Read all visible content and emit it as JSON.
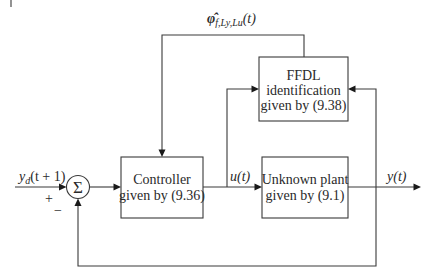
{
  "diagram": {
    "type": "control-block-diagram",
    "blocks": [
      {
        "id": "controller",
        "lines": [
          "Controller",
          "given by (9.36)"
        ]
      },
      {
        "id": "plant",
        "lines": [
          "Unknown plant",
          "given by (9.1)"
        ]
      },
      {
        "id": "ffdl",
        "lines": [
          "FFDL",
          "identification",
          "given by (9.38)"
        ]
      }
    ],
    "summing_junction": {
      "symbol": "Σ",
      "signs": {
        "input": "+",
        "feedback": "−"
      }
    },
    "signals": {
      "reference": {
        "base": "y",
        "sub": "d",
        "arg": "(t + 1)"
      },
      "control": {
        "base": "u",
        "arg": "(t)"
      },
      "output": {
        "base": "y",
        "arg": "(t)"
      },
      "estimate": {
        "base": "φ̂",
        "sub": "f,Ly,Lu",
        "arg": "(t)"
      }
    }
  }
}
